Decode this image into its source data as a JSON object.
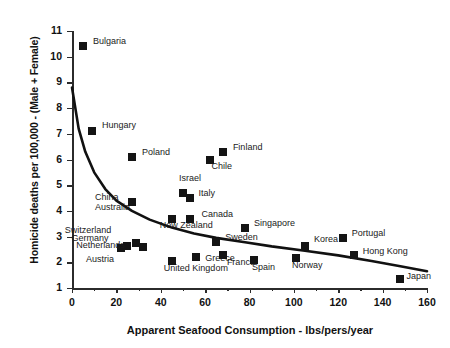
{
  "chart_data": {
    "type": "scatter",
    "title": "",
    "xlabel": "Apparent Seafood Consumption  -  lbs/pers/year",
    "ylabel": "Homicide deaths per 100,000 - (Male + Female)",
    "xlim": [
      0,
      160
    ],
    "ylim": [
      1,
      11
    ],
    "xticks": [
      0,
      20,
      40,
      60,
      80,
      100,
      120,
      140,
      160
    ],
    "yticks": [
      1,
      2,
      3,
      4,
      5,
      6,
      7,
      8,
      9,
      10,
      11
    ],
    "grid": false,
    "legend": "none",
    "points": [
      {
        "label": "Bulgaria",
        "x": 5,
        "y": 10.4,
        "lx": 10,
        "ly": -4
      },
      {
        "label": "Hungary",
        "x": 9,
        "y": 7.1,
        "lx": 10,
        "ly": -5
      },
      {
        "label": "Poland",
        "x": 27,
        "y": 6.1,
        "lx": 10,
        "ly": -4
      },
      {
        "label": "Finland",
        "x": 68,
        "y": 6.3,
        "lx": 10,
        "ly": -4
      },
      {
        "label": "Chile",
        "x": 62,
        "y": 6.0,
        "lx": 2,
        "ly": 7
      },
      {
        "label": "Israel",
        "x": 50,
        "y": 4.7,
        "lx": -4,
        "ly": -14
      },
      {
        "label": "Italy",
        "x": 53,
        "y": 4.5,
        "lx": 9,
        "ly": -4
      },
      {
        "label": "China",
        "x": 27,
        "y": 4.35,
        "lx": -37,
        "ly": -4
      },
      {
        "label": "Australia",
        "x": 27,
        "y": 4.35,
        "lx": -37,
        "ly": 6
      },
      {
        "label": "Canada",
        "x": 53,
        "y": 3.7,
        "lx": 12,
        "ly": -4
      },
      {
        "label": "New Zealand",
        "x": 45,
        "y": 3.7,
        "lx": -12,
        "ly": 7
      },
      {
        "label": "Singapore",
        "x": 78,
        "y": 3.35,
        "lx": 9,
        "ly": -4
      },
      {
        "label": "Portugal",
        "x": 122,
        "y": 2.95,
        "lx": 9,
        "ly": -4
      },
      {
        "label": "Korea",
        "x": 105,
        "y": 2.65,
        "lx": 9,
        "ly": -6
      },
      {
        "label": "Hong Kong",
        "x": 127,
        "y": 2.3,
        "lx": 9,
        "ly": -3
      },
      {
        "label": "Sweden",
        "x": 65,
        "y": 2.8,
        "lx": 9,
        "ly": -4
      },
      {
        "label": "Switzerland",
        "x": 22,
        "y": 2.55,
        "lx": -56,
        "ly": -17
      },
      {
        "label": "Germany",
        "x": 25,
        "y": 2.65,
        "lx": -56,
        "ly": -7
      },
      {
        "label": "Netherlands",
        "x": 29,
        "y": 2.75,
        "lx": -60,
        "ly": 3
      },
      {
        "label": "Austria",
        "x": 32,
        "y": 2.6,
        "lx": -57,
        "ly": 13
      },
      {
        "label": "United Kingdom",
        "x": 45,
        "y": 2.05,
        "lx": -8,
        "ly": 8
      },
      {
        "label": "Greece",
        "x": 56,
        "y": 2.2,
        "lx": 9,
        "ly": 2
      },
      {
        "label": "France",
        "x": 68,
        "y": 2.3,
        "lx": 4,
        "ly": 8
      },
      {
        "label": "Spain",
        "x": 82,
        "y": 2.1,
        "lx": -2,
        "ly": 8
      },
      {
        "label": "Norway",
        "x": 101,
        "y": 2.15,
        "lx": -4,
        "ly": 8
      },
      {
        "label": "Japan",
        "x": 148,
        "y": 1.35,
        "lx": 6,
        "ly": -2
      }
    ],
    "trend": {
      "description": "decaying power-law fit",
      "start": {
        "x": 0,
        "y": 8.8
      },
      "end": {
        "x": 160,
        "y": 1.65
      },
      "points": [
        [
          0,
          8.8
        ],
        [
          3,
          7.2
        ],
        [
          6,
          6.3
        ],
        [
          10,
          5.5
        ],
        [
          15,
          4.85
        ],
        [
          20,
          4.4
        ],
        [
          27,
          4.0
        ],
        [
          35,
          3.66
        ],
        [
          45,
          3.35
        ],
        [
          55,
          3.12
        ],
        [
          65,
          2.95
        ],
        [
          78,
          2.78
        ],
        [
          90,
          2.62
        ],
        [
          105,
          2.45
        ],
        [
          120,
          2.27
        ],
        [
          135,
          2.05
        ],
        [
          148,
          1.85
        ],
        [
          160,
          1.65
        ]
      ]
    }
  },
  "axis": {
    "ytick_labels": [
      "11",
      "10",
      "9",
      "8",
      "7",
      "6",
      "5",
      "4",
      "3",
      "2",
      "1"
    ],
    "xtick_labels": [
      "0",
      "20",
      "40",
      "60",
      "80",
      "100",
      "120",
      "140",
      "160"
    ]
  }
}
